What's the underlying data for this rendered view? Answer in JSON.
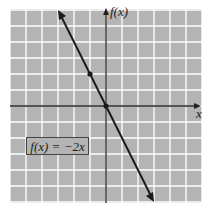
{
  "chart_data": {
    "type": "line",
    "title": "",
    "xlabel": "x",
    "ylabel": "f(x)",
    "xlim": [
      -6,
      6
    ],
    "ylim": [
      -6,
      6
    ],
    "grid": true,
    "series": [
      {
        "name": "f(x) = -2x",
        "x": [
          -3,
          3
        ],
        "y": [
          6,
          -6
        ]
      }
    ],
    "points": [
      {
        "x": -1,
        "y": 2
      },
      {
        "x": 0,
        "y": 0
      }
    ],
    "annotations": [
      "f(x) = −2x"
    ]
  },
  "labels": {
    "y_axis": "f(x)",
    "x_axis": "x",
    "equation": "f(x) = −2x"
  },
  "colors": {
    "grid_background": "#b4b4b4",
    "grid_lines": "#ffffff",
    "axes": "#222222",
    "line": "#1a1a1a"
  }
}
